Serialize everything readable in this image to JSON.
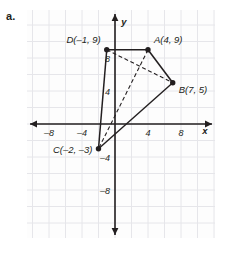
{
  "figure": {
    "item_label": "a.",
    "background": "#ffffff",
    "plot_background": "#fdfdfd",
    "grid_color": "#e6e6ea",
    "axis_color": "#231f20",
    "shape_color": "#231f20"
  },
  "chart_data": {
    "type": "scatter",
    "title": "",
    "xlabel": "x",
    "ylabel": "y",
    "xlim": [
      -10,
      10
    ],
    "ylim": [
      -12,
      12
    ],
    "xticks": [
      -8,
      -4,
      4,
      8
    ],
    "xtick_labels": [
      "-8",
      "-4",
      "4",
      "8"
    ],
    "yticks": [
      -8,
      -4,
      4,
      8
    ],
    "ytick_labels": [
      "-8",
      "-4",
      "4",
      "8"
    ],
    "grid": true,
    "grid_step": 2,
    "legend": "none",
    "points": [
      {
        "name": "A",
        "label": "A(4, 9)",
        "x": 4,
        "y": 9,
        "label_anchor": "left"
      },
      {
        "name": "B",
        "label": "B(7, 5)",
        "x": 7,
        "y": 5,
        "label_anchor": "left"
      },
      {
        "name": "C",
        "label": "C(-2, -3)",
        "x": -2,
        "y": -3,
        "label_anchor": "right"
      },
      {
        "name": "D",
        "label": "D(-1, 9)",
        "x": -1,
        "y": 9,
        "label_anchor": "right"
      }
    ],
    "solid_edges": [
      {
        "from": "D",
        "to": "A"
      },
      {
        "from": "A",
        "to": "B"
      },
      {
        "from": "B",
        "to": "C"
      },
      {
        "from": "C",
        "to": "D"
      }
    ],
    "dashed_edges": [
      {
        "from": "D",
        "to": "B"
      },
      {
        "from": "A",
        "to": "C"
      }
    ]
  }
}
